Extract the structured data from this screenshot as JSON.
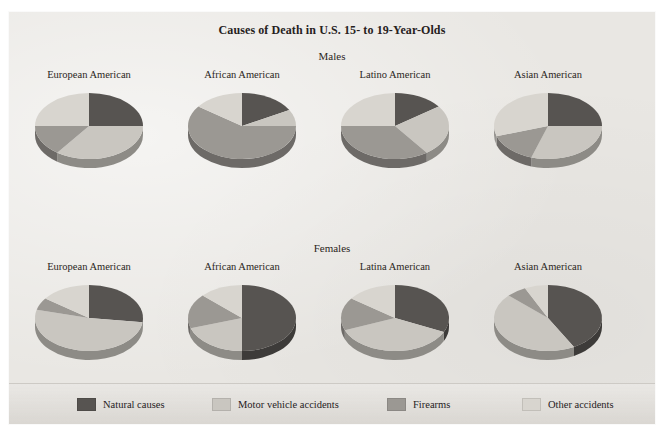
{
  "figure": {
    "title": "Causes of Death in U.S. 15- to 19-Year-Olds",
    "rows": [
      {
        "label": "Males"
      },
      {
        "label": "Females"
      }
    ]
  },
  "legend": {
    "items": [
      {
        "label": "Natural causes",
        "color": "#575451"
      },
      {
        "label": "Motor vehicle accidents",
        "color": "#c9c6c0"
      },
      {
        "label": "Firearms",
        "color": "#9b9893"
      },
      {
        "label": "Other accidents",
        "color": "#d8d5cf"
      }
    ]
  },
  "chart_data": {
    "type": "pie",
    "title": "Causes of Death in U.S. 15- to 19-Year-Olds",
    "categories": [
      "Natural causes",
      "Motor vehicle accidents",
      "Firearms",
      "Other accidents"
    ],
    "colors": [
      "#575451",
      "#c9c6c0",
      "#9b9893",
      "#d8d5cf"
    ],
    "units": "percent",
    "legend_position": "bottom",
    "grid": false,
    "panels": [
      {
        "group": "Males",
        "label": "European American",
        "values": [
          25,
          35,
          15,
          25
        ]
      },
      {
        "group": "Males",
        "label": "African American",
        "values": [
          17,
          8,
          60,
          15
        ]
      },
      {
        "group": "Males",
        "label": "Latino American",
        "values": [
          15,
          25,
          35,
          25
        ]
      },
      {
        "group": "Males",
        "label": "Asian American",
        "values": [
          25,
          30,
          15,
          30
        ]
      },
      {
        "group": "Females",
        "label": "European American",
        "values": [
          27,
          52,
          6,
          15
        ]
      },
      {
        "group": "Females",
        "label": "African American",
        "values": [
          50,
          20,
          17,
          13
        ]
      },
      {
        "group": "Females",
        "label": "Latina American",
        "values": [
          32,
          37,
          16,
          15
        ]
      },
      {
        "group": "Females",
        "label": "Asian American",
        "values": [
          42,
          45,
          6,
          7
        ]
      }
    ]
  }
}
